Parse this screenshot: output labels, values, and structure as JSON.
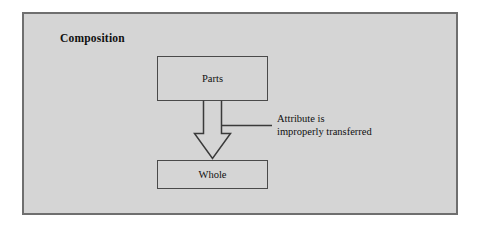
{
  "diagram": {
    "title": "Composition",
    "nodes": [
      {
        "id": "parts",
        "label": "Parts"
      },
      {
        "id": "whole",
        "label": "Whole"
      }
    ],
    "connector": {
      "type": "hollow-open-arrow",
      "from": "parts",
      "to": "whole",
      "direction": "down"
    },
    "annotation": {
      "line1": "Attribute is",
      "line2": "improperly transferred",
      "leader": "horizontal-leader-line"
    },
    "colors": {
      "page_background": "#ffffff",
      "panel_background": "#d5d5d5",
      "panel_border": "#6f6f6f",
      "node_border": "#4a4a4a",
      "stroke": "#3a3a3a",
      "text": "#101010"
    }
  }
}
